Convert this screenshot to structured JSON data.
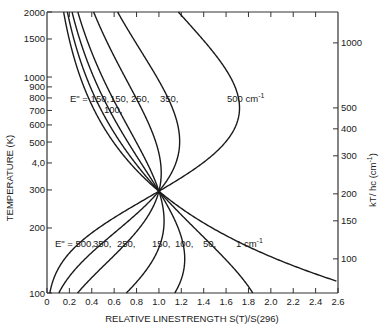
{
  "chart_data": {
    "type": "line",
    "title": "",
    "xlabel": "RELATIVE LINESTRENGTH S(T)/S(296)",
    "ylabel": "TEMPERATURE (K)",
    "ylabel_right": "kT/ hc (cm",
    "ylabel_right_sup": "-1",
    "ylabel_right_close": ")",
    "xlim": [
      0,
      2.6
    ],
    "ylim": [
      100,
      2000
    ],
    "yscale": "log",
    "grid": false,
    "x_ticks": [
      "0",
      "0.2",
      "0.4",
      "0.6",
      "0.8",
      "1.0",
      "1.2",
      "1.4",
      "1.6",
      "1.8",
      "2.0",
      "2.2",
      "2.4",
      "2.6"
    ],
    "y_ticks": [
      100,
      200,
      300,
      400,
      500,
      600,
      700,
      800,
      900,
      1000,
      1500,
      2000
    ],
    "y_tick_labels": [
      "100",
      "200",
      "300",
      "4,0",
      "500",
      "600",
      "700",
      "800",
      "900",
      "1000",
      "1500",
      "2000"
    ],
    "y_right_ticks": [
      100,
      150,
      200,
      300,
      400,
      500,
      1000
    ],
    "reference_temperature": 296,
    "model": "S(T)/S(296) = (296/T) * exp(-1.4388*E''*(1/T - 1/296))",
    "series": [
      {
        "name": "E''=1 cm-1",
        "E_lower": 1,
        "points": [
          [
            2.6,
            104
          ],
          [
            1.98,
            150
          ],
          [
            1.48,
            200
          ],
          [
            1.0,
            296
          ]
        ]
      },
      {
        "name": "E''=50",
        "E_lower": 50,
        "points": [
          [
            1.84,
            100
          ],
          [
            1.44,
            150
          ],
          [
            1.24,
            200
          ],
          [
            1.0,
            296
          ],
          [
            0.64,
            500
          ],
          [
            0.42,
            800
          ],
          [
            0.29,
            1200
          ],
          [
            0.2,
            2000
          ]
        ]
      },
      {
        "name": "E''=100",
        "E_lower": 100,
        "points": [
          [
            1.13,
            100
          ],
          [
            1.07,
            150
          ],
          [
            1.04,
            200
          ],
          [
            1.0,
            296
          ],
          [
            0.8,
            500
          ],
          [
            0.6,
            800
          ],
          [
            0.44,
            1200
          ],
          [
            0.22,
            2000
          ]
        ]
      },
      {
        "name": "E''=150",
        "E_lower": 150,
        "points": [
          [
            0.7,
            100
          ],
          [
            0.86,
            150
          ],
          [
            0.92,
            200
          ],
          [
            1.0,
            296
          ],
          [
            0.96,
            500
          ],
          [
            0.8,
            800
          ],
          [
            0.58,
            1200
          ],
          [
            0.28,
            2000
          ]
        ]
      },
      {
        "name": "E''=250",
        "E_lower": 250,
        "points": [
          [
            0.26,
            100
          ],
          [
            0.55,
            150
          ],
          [
            0.72,
            200
          ],
          [
            1.0,
            296
          ],
          [
            1.05,
            400
          ],
          [
            1.0,
            600
          ],
          [
            0.83,
            1000
          ],
          [
            0.44,
            2000
          ]
        ]
      },
      {
        "name": "E''=350",
        "E_lower": 350,
        "points": [
          [
            0.09,
            100
          ],
          [
            0.34,
            150
          ],
          [
            0.56,
            200
          ],
          [
            1.0,
            296
          ],
          [
            1.12,
            600
          ],
          [
            1.0,
            1000
          ],
          [
            0.65,
            2000
          ]
        ]
      },
      {
        "name": "E''=500 cm-1",
        "E_lower": 500,
        "points": [
          [
            0.0,
            100
          ],
          [
            0.18,
            150
          ],
          [
            0.39,
            200
          ],
          [
            1.0,
            296
          ],
          [
            1.5,
            500
          ],
          [
            1.68,
            800
          ],
          [
            1.5,
            1300
          ],
          [
            1.17,
            2000
          ]
        ]
      }
    ],
    "annotations": [
      {
        "text": "E\" = 1, 50, 150, 250, 350,",
        "region": "upper-left"
      },
      {
        "text": "100",
        "region": "upper-left, below 50/150"
      },
      {
        "text": "500 cm-1",
        "region": "upper-right"
      },
      {
        "text": "E\" = 500, 350, 250, 150, 100, 50, 1 cm-1",
        "region": "lower"
      }
    ]
  },
  "labels": {
    "upper_prefix": "E\" = 1,",
    "upper_50": "50,",
    "upper_150": "150,",
    "upper_100": "100,",
    "upper_250": "250,",
    "upper_350": "350,",
    "upper_500": "500 cm",
    "lower_prefix": "E\" = 500,",
    "lower_350": "350,",
    "lower_250": "250,",
    "lower_150": "150,",
    "lower_100": "100,",
    "lower_50": "50,",
    "lower_1": "1 cm",
    "sup": "-1"
  }
}
